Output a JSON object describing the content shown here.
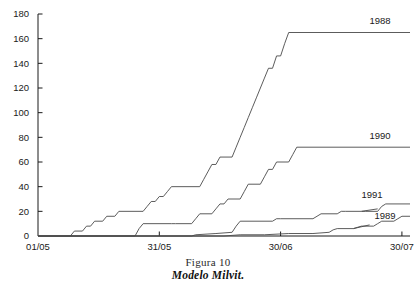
{
  "caption": {
    "line1": "Figura 10",
    "line2": "Modelo Milvit."
  },
  "chart_data": {
    "type": "line",
    "title": "Modelo Milvit.",
    "subtitle": "Figura 10",
    "xlabel": "",
    "ylabel": "",
    "grid": false,
    "legend_position": "right-inline-labels",
    "xlim": [
      0,
      92
    ],
    "ylim": [
      0,
      180
    ],
    "yticks": [
      0,
      20,
      40,
      60,
      80,
      100,
      120,
      140,
      160,
      180
    ],
    "ytick_labels": [
      "0",
      "20",
      "40",
      "60",
      "80",
      "100",
      "120",
      "140",
      "160",
      "180"
    ],
    "xticks": [
      0,
      30,
      60,
      90
    ],
    "xtick_labels": [
      "01/05",
      "31/05",
      "30/06",
      "30/07"
    ],
    "series": [
      {
        "name": "1988",
        "label": "1988",
        "final_value": 165,
        "points": [
          [
            0,
            0
          ],
          [
            8,
            0
          ],
          [
            9,
            4
          ],
          [
            11,
            4
          ],
          [
            12,
            8
          ],
          [
            13,
            8
          ],
          [
            14,
            12
          ],
          [
            16,
            12
          ],
          [
            17,
            16
          ],
          [
            19,
            16
          ],
          [
            20,
            20
          ],
          [
            26,
            20
          ],
          [
            27,
            24
          ],
          [
            28,
            28
          ],
          [
            29,
            28
          ],
          [
            30,
            32
          ],
          [
            31,
            32
          ],
          [
            32,
            36
          ],
          [
            33,
            40
          ],
          [
            40,
            40
          ],
          [
            41,
            46
          ],
          [
            42,
            52
          ],
          [
            43,
            58
          ],
          [
            44,
            58
          ],
          [
            45,
            64
          ],
          [
            48,
            64
          ],
          [
            49,
            72
          ],
          [
            50,
            80
          ],
          [
            51,
            88
          ],
          [
            52,
            96
          ],
          [
            53,
            104
          ],
          [
            54,
            112
          ],
          [
            55,
            120
          ],
          [
            56,
            128
          ],
          [
            57,
            136
          ],
          [
            58,
            136
          ],
          [
            59,
            146
          ],
          [
            60,
            146
          ],
          [
            61,
            156
          ],
          [
            62,
            165
          ],
          [
            92,
            165
          ]
        ]
      },
      {
        "name": "1990",
        "label": "1990",
        "final_value": 72,
        "points": [
          [
            0,
            0
          ],
          [
            24,
            0
          ],
          [
            25,
            6
          ],
          [
            26,
            10
          ],
          [
            33,
            10
          ],
          [
            34,
            10
          ],
          [
            38,
            10
          ],
          [
            39,
            14
          ],
          [
            40,
            18
          ],
          [
            43,
            18
          ],
          [
            44,
            22
          ],
          [
            45,
            26
          ],
          [
            46,
            26
          ],
          [
            47,
            30
          ],
          [
            50,
            30
          ],
          [
            51,
            36
          ],
          [
            52,
            42
          ],
          [
            55,
            42
          ],
          [
            56,
            48
          ],
          [
            57,
            54
          ],
          [
            58,
            54
          ],
          [
            59,
            60
          ],
          [
            62,
            60
          ],
          [
            63,
            66
          ],
          [
            64,
            72
          ],
          [
            92,
            72
          ]
        ]
      },
      {
        "name": "1991",
        "label": "1991",
        "final_value": 26,
        "points": [
          [
            0,
            0
          ],
          [
            38,
            0
          ],
          [
            39,
            1
          ],
          [
            44,
            2
          ],
          [
            48,
            3
          ],
          [
            49,
            8
          ],
          [
            50,
            12
          ],
          [
            58,
            12
          ],
          [
            59,
            14
          ],
          [
            60,
            14
          ],
          [
            68,
            14
          ],
          [
            69,
            16
          ],
          [
            70,
            18
          ],
          [
            74,
            18
          ],
          [
            75,
            20
          ],
          [
            76,
            20
          ],
          [
            80,
            20
          ],
          [
            81,
            20
          ],
          [
            84,
            20
          ],
          [
            85,
            24
          ],
          [
            86,
            26
          ],
          [
            92,
            26
          ]
        ]
      },
      {
        "name": "1989",
        "label": "1989",
        "final_value": 16,
        "points": [
          [
            0,
            0
          ],
          [
            46,
            0
          ],
          [
            50,
            1
          ],
          [
            56,
            1
          ],
          [
            62,
            2
          ],
          [
            68,
            2
          ],
          [
            72,
            3
          ],
          [
            73,
            5
          ],
          [
            74,
            6
          ],
          [
            78,
            6
          ],
          [
            79,
            7
          ],
          [
            80,
            8
          ],
          [
            83,
            8
          ],
          [
            84,
            10
          ],
          [
            85,
            12
          ],
          [
            88,
            12
          ],
          [
            89,
            14
          ],
          [
            90,
            16
          ],
          [
            92,
            16
          ]
        ]
      }
    ]
  },
  "colors": {
    "axis": "#1a1a1a",
    "line": "#4a4a4a",
    "background": "#ffffff"
  }
}
